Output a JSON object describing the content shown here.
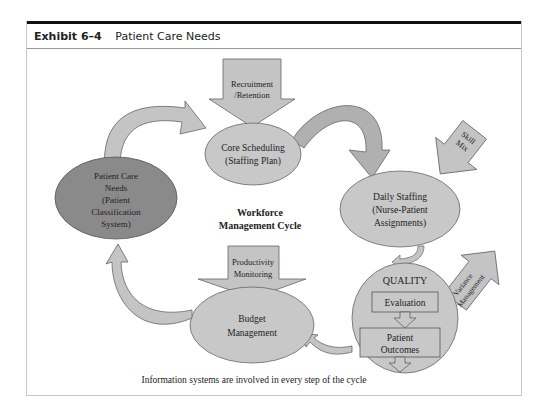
{
  "exhibit": {
    "number": "Exhibit 6–4",
    "title": "Patient Care Needs"
  },
  "diagram": {
    "center_title_line1": "Workforce",
    "center_title_line2": "Management Cycle",
    "nodes": {
      "patient_care_needs": [
        "Patient Care",
        "Needs",
        "(Patient",
        "Classification",
        "System)"
      ],
      "core_scheduling": [
        "Core Scheduling",
        "(Staffing Plan)"
      ],
      "daily_staffing": [
        "Daily Staffing",
        "(Nurse-Patient",
        "Assignments)"
      ],
      "quality": {
        "title": "QUALITY",
        "evaluation": "Evaluation",
        "outcomes": [
          "Patient",
          "Outcomes"
        ]
      },
      "budget_management": [
        "Budget",
        "Management"
      ]
    },
    "inputs": {
      "recruitment": [
        "Recruitment",
        "/Retention"
      ],
      "skill_mix": [
        "Skill",
        "Mix"
      ],
      "variance": [
        "Variance",
        "Management"
      ],
      "productivity": [
        "Productivity",
        "Monitoring"
      ]
    },
    "caption": "Information systems are involved in every step of the cycle",
    "colors": {
      "node_fill": "#c8c8c8",
      "node_dark": "#8a8a8a",
      "arrow_fill": "#c4c4c4",
      "arrow_shadow": "#9a9a9a",
      "stroke": "#555555"
    }
  }
}
